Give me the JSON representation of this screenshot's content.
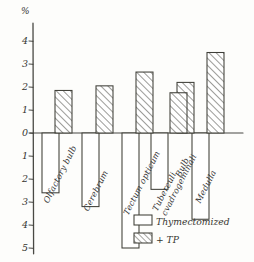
{
  "chart_data": {
    "type": "bar",
    "title": "",
    "xlabel": "",
    "ylabel": "%",
    "ylim": [
      -5,
      4.6
    ],
    "grid": false,
    "legend_position": "bottom-right",
    "ytick_labels": [
      "4",
      "3",
      "2",
      "1",
      "0",
      "1",
      "2",
      "3",
      "4",
      "5"
    ],
    "ytick_values": [
      4,
      3,
      2,
      1,
      0,
      -1,
      -2,
      -3,
      -4,
      -5
    ],
    "categories": [
      "Olfactory bulb",
      "Cerebrum",
      "Tectum opticum",
      "Tuberculi cvadrogeminali",
      "Bulb",
      "Medulla"
    ],
    "series": [
      {
        "name": "Thymectomized",
        "fill": "white",
        "values": [
          -2.6,
          -3.2,
          -5.0,
          -2.45,
          -0.05,
          -3.75
        ]
      },
      {
        "name": "+ TP",
        "fill": "hatched",
        "values": [
          1.85,
          2.05,
          2.65,
          2.2,
          1.75,
          3.5
        ]
      }
    ]
  },
  "axis": {
    "unit_label": "%"
  },
  "legend": {
    "items": [
      {
        "label": "Thymectomized",
        "swatch": "white"
      },
      {
        "label": "+ TP",
        "swatch": "hatched"
      }
    ]
  },
  "colors": {
    "ink": "#35352f",
    "paper": "#fdfdfb",
    "hatch": "#4a4a44"
  }
}
